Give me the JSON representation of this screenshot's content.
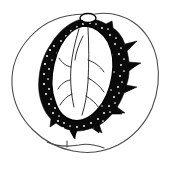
{
  "figure": {
    "title": "Fruit cross-section line drawing",
    "style": "black-and-white botanical pen-and-ink illustration",
    "background_color": "#ffffff",
    "ink_color": "#000000",
    "outline_color": "#4a4a4a",
    "canvas": {
      "width": 173,
      "height": 169
    },
    "parts": [
      {
        "id": "fruit-outline",
        "label": "Outer fruit flesh outline",
        "description": "thin gray rounded outline of the whole fruit, slightly flattened at the bottom with a small notch",
        "stroke_color": "#4a4a4a",
        "stroke_width": 1.1,
        "fill": "none"
      },
      {
        "id": "pit-shell",
        "label": "Stippled pit shell",
        "description": "dark textured ring enclosing the seed, with thorn-like spikes on the right side and a scalloped lower edge",
        "fill_color": "#0a0a0a",
        "texture": "stipple"
      },
      {
        "id": "seed-body",
        "label": "Inner seed body",
        "description": "white almond-shaped kernel inside the shell",
        "fill_color": "#ffffff",
        "stroke_color": "#000000"
      },
      {
        "id": "seed-veins",
        "label": "Seed surface veins",
        "description": "branching thin lines running lengthwise down the kernel face",
        "stroke_color": "#1a1a1a",
        "stroke_width": 0.9,
        "vein_count": 9
      },
      {
        "id": "stem-attachment",
        "label": "Stem attachment knob",
        "description": "small oval knob at the apex of the pit where the stalk joins",
        "stroke_color": "#000000",
        "fill_color": "#ffffff"
      },
      {
        "id": "bottom-notch",
        "label": "Basal notch tick",
        "description": "short tick mark crossing the fruit outline at the base",
        "stroke_color": "#3a3a3a"
      }
    ],
    "spikes": {
      "label": "Shell spikes",
      "count": 6,
      "side": "right",
      "description": "pointed projections radiating outward from the stippled shell"
    }
  }
}
